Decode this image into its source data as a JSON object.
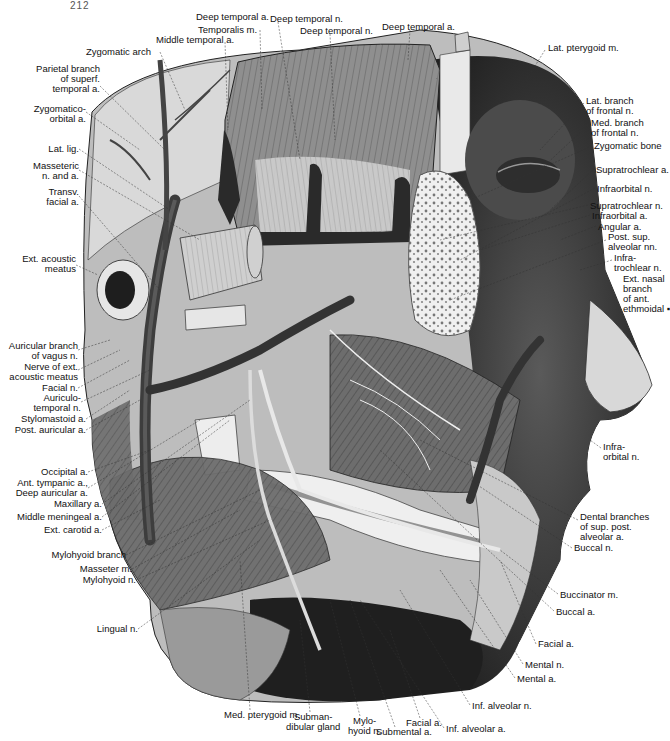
{
  "page_number": "212",
  "figure": {
    "labels_top": [
      {
        "id": "deep-temporal-a-1",
        "text": "Deep temporal a.",
        "x": 196,
        "y": 12,
        "align": "l"
      },
      {
        "id": "deep-temporal-n-1",
        "text": "Deep temporal n.",
        "x": 270,
        "y": 14,
        "align": "l"
      },
      {
        "id": "temporalis-m",
        "text": "Temporalis m.",
        "x": 198,
        "y": 25,
        "align": "l"
      },
      {
        "id": "deep-temporal-n-2",
        "text": "Deep temporal n.",
        "x": 300,
        "y": 26,
        "align": "l"
      },
      {
        "id": "deep-temporal-a-2",
        "text": "Deep temporal a.",
        "x": 382,
        "y": 22,
        "align": "l"
      },
      {
        "id": "middle-temporal-a",
        "text": "Middle temporal a.",
        "x": 156,
        "y": 35,
        "align": "l"
      },
      {
        "id": "zygomatic-arch",
        "text": "Zygomatic arch",
        "x": 86,
        "y": 47,
        "align": "l"
      }
    ],
    "labels_left": [
      {
        "id": "parietal-branch",
        "text": "Parietal branch\nof superf.\ntemporal a.",
        "x": 6,
        "y": 64,
        "w": 94
      },
      {
        "id": "zygomatico-orbital-a",
        "text": "Zygomatico-\norbital a.",
        "x": 6,
        "y": 104,
        "w": 80
      },
      {
        "id": "lat-lig",
        "text": "Lat. lig.",
        "x": 6,
        "y": 144,
        "w": 73
      },
      {
        "id": "masseteric-n-and-a",
        "text": "Masseteric\nn. and a.",
        "x": 6,
        "y": 161,
        "w": 73
      },
      {
        "id": "transv-facial-a",
        "text": "Transv.\nfacial a.",
        "x": 6,
        "y": 187,
        "w": 73
      },
      {
        "id": "ext-acoustic-meatus",
        "text": "Ext. acoustic\nmeatus",
        "x": 6,
        "y": 254,
        "w": 70
      },
      {
        "id": "auricular-branch-vagus",
        "text": "Auricular branch\nof vagus n.",
        "x": 6,
        "y": 341,
        "w": 72
      },
      {
        "id": "nerve-ext-acoustic-meatus",
        "text": "Nerve of ext.\nacoustic meatus",
        "x": 6,
        "y": 362,
        "w": 72
      },
      {
        "id": "facial-n",
        "text": "Facial n.",
        "x": 6,
        "y": 383,
        "w": 72
      },
      {
        "id": "auriculotemporal-n",
        "text": "Auriculo-\ntemporal n.",
        "x": 6,
        "y": 393,
        "w": 75
      },
      {
        "id": "stylomastoid-a",
        "text": "Stylomastoid a.",
        "x": 6,
        "y": 414,
        "w": 80
      },
      {
        "id": "post-auricular-a",
        "text": "Post. auricular a.",
        "x": 6,
        "y": 425,
        "w": 80
      },
      {
        "id": "occipital-a",
        "text": "Occipital a.",
        "x": 6,
        "y": 467,
        "w": 82
      },
      {
        "id": "ant-tympanic-a",
        "text": "Ant. tympanic a.,\nDeep auricular a.",
        "x": 6,
        "y": 478,
        "w": 82
      },
      {
        "id": "maxillary-a",
        "text": "Maxillary a.",
        "x": 6,
        "y": 499,
        "w": 96
      },
      {
        "id": "middle-meningeal-a",
        "text": "Middle meningeal a.",
        "x": 6,
        "y": 512,
        "w": 96
      },
      {
        "id": "ext-carotid-a",
        "text": "Ext. carotid a.",
        "x": 6,
        "y": 525,
        "w": 96
      },
      {
        "id": "mylohyoid-branch",
        "text": "Mylohyoid branch",
        "x": 6,
        "y": 550,
        "w": 120
      },
      {
        "id": "masseter-m",
        "text": "Masseter m.",
        "x": 6,
        "y": 564,
        "w": 126
      },
      {
        "id": "mylohyoid-n",
        "text": "Mylohyoid n.",
        "x": 6,
        "y": 575,
        "w": 130
      },
      {
        "id": "lingual-n",
        "text": "Lingual n.",
        "x": 6,
        "y": 624,
        "w": 132
      }
    ],
    "labels_right": [
      {
        "id": "lat-pterygoid-m",
        "text": "Lat. pterygoid m.",
        "x": 548,
        "y": 43
      },
      {
        "id": "lat-branch-frontal-n",
        "text": "Lat. branch\nof frontal n.",
        "x": 586,
        "y": 96
      },
      {
        "id": "med-branch-frontal-n",
        "text": "Med. branch\nof frontal n.",
        "x": 591,
        "y": 118
      },
      {
        "id": "zygomatic-bone",
        "text": "Zygomatic bone",
        "x": 594,
        "y": 141
      },
      {
        "id": "supratrochlear-a",
        "text": "Supratrochlear a.",
        "x": 596,
        "y": 165
      },
      {
        "id": "infraorbital-n",
        "text": "Infraorbital n.",
        "x": 597,
        "y": 184
      },
      {
        "id": "supratrochlear-n",
        "text": "Supratrochlear n.",
        "x": 590,
        "y": 201
      },
      {
        "id": "infraorbital-a",
        "text": "Infraorbital a.",
        "x": 592,
        "y": 211
      },
      {
        "id": "angular-a",
        "text": "Angular a.",
        "x": 598,
        "y": 222
      },
      {
        "id": "post-sup-alveolar-nn",
        "text": "Post. sup.\nalveolar nn.",
        "x": 608,
        "y": 232
      },
      {
        "id": "infratrochlear-n",
        "text": "Infra-\ntrochlear n.",
        "x": 614,
        "y": 253
      },
      {
        "id": "ext-nasal-branch",
        "text": "Ext. nasal\nbranch\nof ant.\nethmoidal ▪",
        "x": 623,
        "y": 274
      },
      {
        "id": "infraorbital-n-2",
        "text": "Infra-\norbital n.",
        "x": 603,
        "y": 442
      },
      {
        "id": "dental-branches",
        "text": "Dental branches\nof sup. post.\nalveolar a.",
        "x": 580,
        "y": 512
      },
      {
        "id": "buccal-n",
        "text": "Buccal n.",
        "x": 574,
        "y": 543
      },
      {
        "id": "buccinator-m",
        "text": "Buccinator m.",
        "x": 560,
        "y": 590
      },
      {
        "id": "buccal-a",
        "text": "Buccal a.",
        "x": 556,
        "y": 607
      },
      {
        "id": "facial-a-right",
        "text": "Facial a.",
        "x": 538,
        "y": 639
      },
      {
        "id": "mental-n",
        "text": "Mental n.",
        "x": 525,
        "y": 660
      },
      {
        "id": "mental-a",
        "text": "Mental a.",
        "x": 517,
        "y": 674
      },
      {
        "id": "inf-alveolar-n",
        "text": "Inf. alveolar n.",
        "x": 472,
        "y": 701
      },
      {
        "id": "inf-alveolar-a",
        "text": "Inf. alveolar a.",
        "x": 446,
        "y": 724
      }
    ],
    "labels_bottom": [
      {
        "id": "med-pterygoid-m",
        "text": "Med. pterygoid m.",
        "x": 224,
        "y": 710
      },
      {
        "id": "submandibular-gland",
        "text": "Subman-\ndibular gland",
        "x": 286,
        "y": 712
      },
      {
        "id": "mylohyoid-n-bottom",
        "text": "Mylo-\nhyoid n.",
        "x": 348,
        "y": 716
      },
      {
        "id": "facial-a-bottom",
        "text": "Facial a.",
        "x": 406,
        "y": 718
      },
      {
        "id": "submental-a",
        "text": "Submental a.",
        "x": 376,
        "y": 727
      }
    ]
  },
  "colors": {
    "ink": "#111111",
    "skin_light": "#e6e6e6",
    "muscle_mid": "#8a8a8a",
    "muscle_dark": "#3a3a3a",
    "bone": "#f2f2f2",
    "shadow": "#1c1c1c"
  }
}
